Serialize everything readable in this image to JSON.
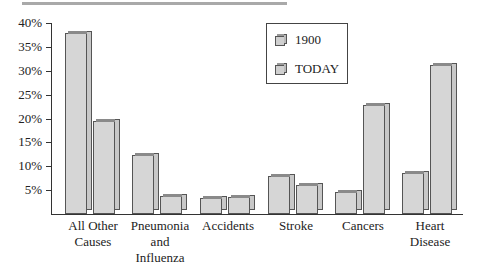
{
  "chart_data": {
    "type": "bar",
    "title": "",
    "xlabel": "",
    "ylabel": "",
    "ylim": [
      0,
      40
    ],
    "yticks": [
      "5%",
      "10%",
      "15%",
      "20%",
      "25%",
      "30%",
      "35%",
      "40%"
    ],
    "categories": [
      "All Other Causes",
      "Pneumonia and Influenza",
      "Accidents",
      "Stroke",
      "Cancers",
      "Heart Disease"
    ],
    "category_lines": [
      [
        "All Other",
        "Causes"
      ],
      [
        "Pneumonia",
        "and",
        "Influenza"
      ],
      [
        "Accidents"
      ],
      [
        "Stroke"
      ],
      [
        "Cancers"
      ],
      [
        "Heart",
        "Disease"
      ]
    ],
    "series": [
      {
        "name": "1900",
        "values": [
          38,
          12.3,
          3.3,
          8,
          4.6,
          8.6
        ]
      },
      {
        "name": "TODAY",
        "values": [
          19.5,
          3.8,
          3.6,
          6,
          22.8,
          31.2
        ]
      }
    ],
    "legend_position": "upper right (inside plot)",
    "grid": false,
    "bar_color": "#d6d6d6"
  },
  "legend": {
    "items": [
      "1900",
      "TODAY"
    ]
  }
}
